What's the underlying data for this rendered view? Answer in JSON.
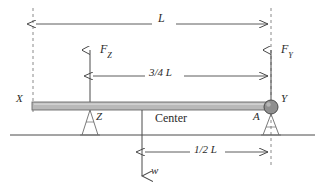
{
  "diagram": {
    "type": "statics-free-body-diagram",
    "colors": {
      "line": "#4a4a4a",
      "beam_fill": "#b9b9b9",
      "beam_stroke": "#6b6b6b",
      "pin_fill": "#8f8f8f",
      "pin_stroke": "#4a4a4a",
      "text": "#2b2b2b",
      "background": "#ffffff"
    },
    "labels": {
      "span_total": "L",
      "force_left": "F",
      "force_left_sub": "Z",
      "force_right": "F",
      "force_right_sub": "Y",
      "dim_three_quarter": "3/4 L",
      "dim_half": "1/2 L",
      "point_x": "X",
      "point_y": "Y",
      "support_z": "Z",
      "support_a": "A",
      "center": "Center",
      "load_w": "w"
    },
    "geometry": {
      "beam_left_x": 32,
      "beam_right_x": 272,
      "beam_top_y": 102,
      "beam_bottom_y": 110,
      "ground_y": 135,
      "ground_left_x": 10,
      "ground_right_x": 315,
      "dashed_left_x": 33,
      "dashed_right_x": 271,
      "dim_L_y": 24,
      "dim_34L_y": 76,
      "dim_12L_y": 152,
      "force_z_x": 90,
      "force_y_x": 271,
      "center_x": 142,
      "pin_center_x": 271,
      "pin_center_y": 107,
      "pin_radius": 7,
      "load_arrow_tip_y": 178
    }
  }
}
